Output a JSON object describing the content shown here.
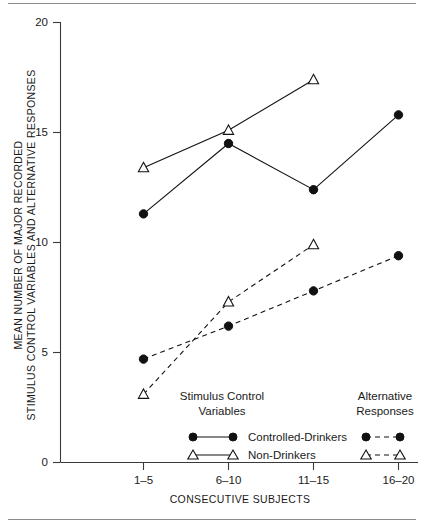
{
  "figure": {
    "rule_top_name": "top-rule",
    "rule_bottom_name": "bottom-rule"
  },
  "chart_data": {
    "type": "line",
    "title": "",
    "xlabel": "CONSECUTIVE SUBJECTS",
    "ylabel_line1": "MEAN NUMBER OF MAJOR RECORDED",
    "ylabel_line2": "STIMULUS CONTROL VARIABLES AND ALTERNATIVE RESPONSES",
    "categories": [
      "1–5",
      "6–10",
      "11–15",
      "16–20"
    ],
    "ylim": [
      0,
      20
    ],
    "yticks": [
      0,
      5,
      10,
      15,
      20
    ],
    "ytick_labels": [
      "0",
      "5",
      "10",
      "15",
      "20"
    ],
    "grid": false,
    "legend_position": "inside-bottom",
    "series": [
      {
        "name": "Controlled-Drinkers",
        "measure": "Stimulus Control Variables",
        "marker": "filled-circle",
        "linestyle": "solid",
        "values": [
          11.3,
          14.5,
          12.4,
          15.8
        ]
      },
      {
        "name": "Non-Drinkers",
        "measure": "Stimulus Control Variables",
        "marker": "open-triangle",
        "linestyle": "solid",
        "values": [
          13.4,
          15.1,
          17.4,
          null
        ]
      },
      {
        "name": "Controlled-Drinkers",
        "measure": "Alternative Responses",
        "marker": "filled-circle",
        "linestyle": "dashed",
        "values": [
          4.7,
          6.2,
          7.8,
          9.4
        ]
      },
      {
        "name": "Non-Drinkers",
        "measure": "Alternative Responses",
        "marker": "open-triangle",
        "linestyle": "dashed",
        "values": [
          3.1,
          7.3,
          9.9,
          null
        ]
      }
    ]
  },
  "legend": {
    "group_left_line1": "Stimulus Control",
    "group_left_line2": "Variables",
    "group_right_line1": "Alternative",
    "group_right_line2": "Responses",
    "rows": [
      {
        "label": "Controlled-Drinkers",
        "marker": "filled-circle"
      },
      {
        "label": "Non-Drinkers",
        "marker": "open-triangle"
      }
    ]
  }
}
